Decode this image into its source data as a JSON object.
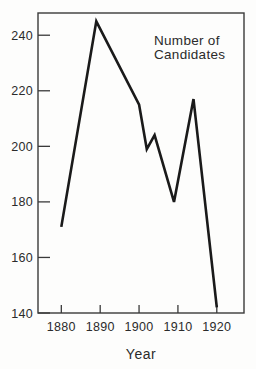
{
  "figure": {
    "background": "#fdfdfc"
  },
  "chart_data": {
    "type": "line",
    "title": "",
    "annotation": {
      "lines": [
        "Number of",
        "Candidates"
      ]
    },
    "xlabel": "Year",
    "ylabel": "",
    "x_ticks": [
      1880,
      1890,
      1900,
      1910,
      1920
    ],
    "y_ticks": [
      140,
      160,
      180,
      200,
      220,
      240
    ],
    "x_range": [
      1874,
      1927
    ],
    "y_range": [
      140,
      248
    ],
    "grid": false,
    "legend_position": "none",
    "series": [
      {
        "name": "Number of Candidates",
        "points": [
          {
            "year": 1880,
            "value": 171
          },
          {
            "year": 1889,
            "value": 245
          },
          {
            "year": 1900,
            "value": 215
          },
          {
            "year": 1902,
            "value": 199
          },
          {
            "year": 1904,
            "value": 204
          },
          {
            "year": 1909,
            "value": 180
          },
          {
            "year": 1914,
            "value": 217
          },
          {
            "year": 1920,
            "value": 142
          }
        ]
      }
    ],
    "colors": {
      "line": "#1a1a1a",
      "axis": "#3a3a3a",
      "text": "#2b2b2b"
    }
  }
}
